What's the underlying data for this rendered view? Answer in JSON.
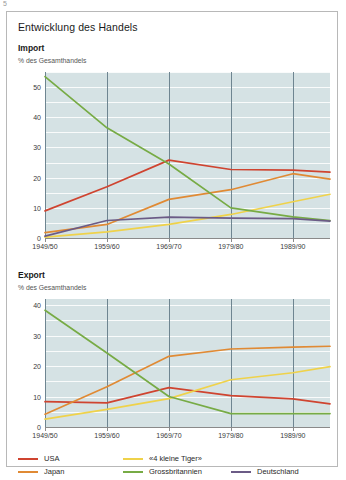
{
  "page_mark": "5",
  "card": {
    "title": "Entwicklung des Handels"
  },
  "legend": {
    "items": [
      {
        "label": "USA",
        "color": "#cf4430"
      },
      {
        "label": "Japan",
        "color": "#e08a34"
      },
      {
        "label": "«4 kleine Tiger»",
        "color": "#efd24a"
      },
      {
        "label": "Grossbritannien",
        "color": "#77ab45"
      },
      {
        "label": "Deutschland",
        "color": "#6b5b86"
      }
    ]
  },
  "chart_data": [
    {
      "type": "line",
      "title": "Import",
      "subtitle": "% des Gesamthandels",
      "xlabel": "",
      "ylabel": "% des Gesamthandels",
      "categories": [
        "1949/50",
        "1959/60",
        "1969/70",
        "1979/80",
        "1989/90",
        ""
      ],
      "x": [
        1949,
        1959,
        1969,
        1979,
        1989,
        1995
      ],
      "ylim": [
        0,
        55
      ],
      "yticks": [
        0,
        10,
        20,
        30,
        40,
        50
      ],
      "grid": true,
      "legend_position": "bottom",
      "series": [
        {
          "name": "USA",
          "color": "#cf4430",
          "values": [
            9.0,
            17.0,
            25.8,
            22.7,
            22.5,
            21.8
          ]
        },
        {
          "name": "Japan",
          "color": "#e08a34",
          "values": [
            1.8,
            4.5,
            12.8,
            16.0,
            21.3,
            19.5
          ]
        },
        {
          "name": "«4 kleine Tiger»",
          "color": "#efd24a",
          "values": [
            0.3,
            2.0,
            4.5,
            7.8,
            12.0,
            14.5
          ]
        },
        {
          "name": "Grossbritannien",
          "color": "#77ab45",
          "values": [
            53.5,
            36.5,
            24.5,
            10.0,
            7.0,
            5.8
          ]
        },
        {
          "name": "Deutschland",
          "color": "#6b5b86",
          "values": [
            0.6,
            5.8,
            6.9,
            6.6,
            6.4,
            5.6
          ]
        }
      ]
    },
    {
      "type": "line",
      "title": "Export",
      "subtitle": "% des Gesamthandels",
      "xlabel": "",
      "ylabel": "% des Gesamthandels",
      "categories": [
        "1949/50",
        "1959/60",
        "1969/70",
        "1979/80",
        "1989/90",
        ""
      ],
      "x": [
        1949,
        1959,
        1969,
        1979,
        1989,
        1995
      ],
      "ylim": [
        0,
        42
      ],
      "yticks": [
        0,
        10,
        20,
        30,
        40
      ],
      "grid": true,
      "legend_position": "bottom",
      "series": [
        {
          "name": "USA",
          "color": "#cf4430",
          "values": [
            8.3,
            7.9,
            12.9,
            10.3,
            9.2,
            7.6
          ]
        },
        {
          "name": "Japan",
          "color": "#e08a34",
          "values": [
            4.2,
            13.2,
            23.2,
            25.6,
            26.2,
            26.5
          ]
        },
        {
          "name": "«4 kleine Tiger»",
          "color": "#efd24a",
          "values": [
            2.6,
            5.8,
            9.3,
            15.5,
            17.8,
            19.8
          ]
        },
        {
          "name": "Grossbritannien",
          "color": "#77ab45",
          "values": [
            38.3,
            24.3,
            10.0,
            4.4,
            4.4,
            4.4
          ]
        },
        {
          "name": "Deutschland",
          "color": "#6b5b86",
          "values": [
            null,
            null,
            null,
            null,
            null,
            null
          ]
        }
      ]
    }
  ]
}
